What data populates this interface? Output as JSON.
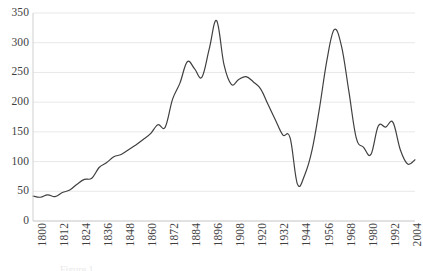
{
  "chart_data": {
    "type": "line",
    "title": "",
    "subtitle": "",
    "xlabel": "",
    "ylabel": "",
    "xlim": [
      1800,
      2008
    ],
    "ylim": [
      0,
      350
    ],
    "grid": true,
    "grid_axis": "y",
    "legend": false,
    "legend_position": "none",
    "line_color": "#404040",
    "line_width": 1.2,
    "x_tick_labels": [
      "1800",
      "1812",
      "1824",
      "1836",
      "1848",
      "1860",
      "1872",
      "1884",
      "1896",
      "1908",
      "1920",
      "1932",
      "1944",
      "1956",
      "1968",
      "1980",
      "1992",
      "2004"
    ],
    "x_tick_values": [
      1800,
      1812,
      1824,
      1836,
      1848,
      1860,
      1872,
      1884,
      1896,
      1908,
      1920,
      1932,
      1944,
      1956,
      1968,
      1980,
      1992,
      2004
    ],
    "y_tick_labels": [
      "0",
      "50",
      "100",
      "150",
      "200",
      "250",
      "300",
      "350"
    ],
    "y_tick_values": [
      0,
      50,
      100,
      150,
      200,
      250,
      300,
      350
    ],
    "series": [
      {
        "name": "value",
        "x": [
          1800,
          1804,
          1808,
          1812,
          1816,
          1820,
          1824,
          1828,
          1832,
          1836,
          1840,
          1844,
          1848,
          1852,
          1856,
          1860,
          1864,
          1868,
          1872,
          1876,
          1880,
          1884,
          1888,
          1892,
          1896,
          1900,
          1904,
          1908,
          1912,
          1916,
          1920,
          1924,
          1928,
          1932,
          1936,
          1940,
          1944,
          1948,
          1952,
          1956,
          1960,
          1964,
          1968,
          1972,
          1976,
          1980,
          1984,
          1988,
          1992,
          1996,
          2000,
          2004,
          2008
        ],
        "values": [
          42,
          40,
          44,
          41,
          48,
          52,
          62,
          70,
          72,
          90,
          98,
          108,
          112,
          120,
          128,
          137,
          147,
          162,
          158,
          205,
          232,
          268,
          256,
          242,
          290,
          337,
          263,
          230,
          238,
          243,
          234,
          222,
          196,
          170,
          145,
          140,
          62,
          78,
          120,
          190,
          270,
          322,
          294,
          218,
          140,
          124,
          112,
          160,
          158,
          166,
          120,
          96,
          103
        ]
      }
    ],
    "annotations": []
  },
  "caption": {
    "text": "Figure 1."
  }
}
